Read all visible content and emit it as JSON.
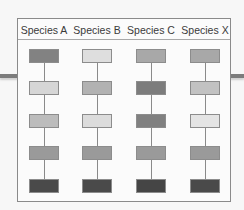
{
  "diagram": {
    "columns": [
      {
        "label": "Species A",
        "shades": [
          "#828282",
          "#d6d6d6",
          "#bcbcbc",
          "#9a9a9a",
          "#4a4a4a"
        ]
      },
      {
        "label": "Species B",
        "shades": [
          "#dedede",
          "#b2b2b2",
          "#dcdcdc",
          "#9a9a9a",
          "#4a4a4a"
        ]
      },
      {
        "label": "Species C",
        "shades": [
          "#a8a8a8",
          "#7c7c7c",
          "#808080",
          "#9a9a9a",
          "#454545"
        ]
      },
      {
        "label": "Species X",
        "shades": [
          "#a8a8a8",
          "#c2c2c2",
          "#e4e4e4",
          "#9a9a9a",
          "#4a4a4a"
        ]
      }
    ]
  }
}
